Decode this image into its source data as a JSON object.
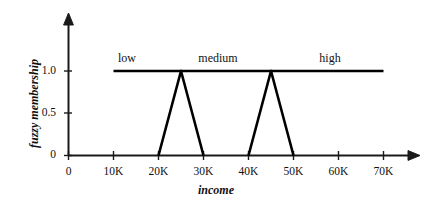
{
  "chart_data": {
    "type": "line",
    "title": "",
    "xlabel": "income",
    "ylabel": "fuzzy membership",
    "grid": false,
    "legend_position": "inline-above-curves",
    "xlim": [
      0,
      78000
    ],
    "ylim": [
      0,
      1.25
    ],
    "x_tick_labels": [
      "0",
      "10K",
      "20K",
      "30K",
      "40K",
      "50K",
      "60K",
      "70K"
    ],
    "x_tick_values": [
      0,
      10000,
      20000,
      30000,
      40000,
      50000,
      60000,
      70000
    ],
    "y_tick_labels": [
      "0",
      "0.5",
      "1.0"
    ],
    "y_tick_values": [
      0,
      0.5,
      1.0
    ],
    "series": [
      {
        "name": "low",
        "label": "low",
        "x": [
          10000,
          25000,
          30000
        ],
        "values": [
          1.0,
          1.0,
          0.0
        ]
      },
      {
        "name": "medium",
        "label": "medium",
        "x": [
          20000,
          25000,
          45000,
          50000
        ],
        "values": [
          0.0,
          1.0,
          1.0,
          0.0
        ]
      },
      {
        "name": "high",
        "label": "high",
        "x": [
          40000,
          45000,
          70000
        ],
        "values": [
          0.0,
          1.0,
          1.0
        ]
      }
    ],
    "annotations": [
      {
        "text": "low",
        "x": 13500,
        "y": 1.14
      },
      {
        "text": "medium",
        "x": 33500,
        "y": 1.14
      },
      {
        "text": "high",
        "x": 58500,
        "y": 1.14
      }
    ],
    "line_color": "#000000",
    "axis_color": "#1a1a1a",
    "background": "#ffffff"
  },
  "axes": {
    "x_title": "income",
    "y_title": "fuzzy membership"
  },
  "ticks": {
    "x": [
      "0",
      "10K",
      "20K",
      "30K",
      "40K",
      "50K",
      "60K",
      "70K"
    ],
    "y": [
      "1.0",
      "0.5",
      "0"
    ]
  },
  "curve_labels": {
    "low": "low",
    "medium": "medium",
    "high": "high"
  }
}
